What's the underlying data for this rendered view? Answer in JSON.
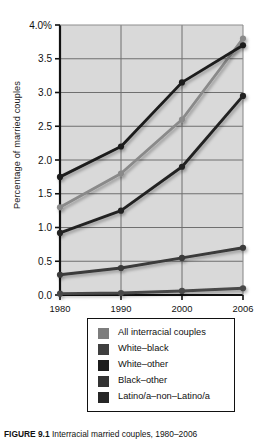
{
  "figure": {
    "caption_label": "FIGURE 9.1",
    "caption_text": "Interracial married couples, 1980–2006"
  },
  "chart_data": {
    "type": "line",
    "title": "",
    "xlabel": "",
    "ylabel": "Percentage of married couples",
    "x": [
      1980,
      1990,
      2000,
      2006
    ],
    "categories": [
      "1980",
      "1990",
      "2000",
      "2006"
    ],
    "xtick_labels": [
      "1980",
      "1990",
      "2000",
      "2006"
    ],
    "ytick_labels": [
      "0.0",
      "0.5",
      "1.0",
      "1.5",
      "2.0",
      "2.5",
      "3.0",
      "3.5",
      "4.0%"
    ],
    "ytick_values": [
      0.0,
      0.5,
      1.0,
      1.5,
      2.0,
      2.5,
      3.0,
      3.5,
      4.0
    ],
    "ylim": [
      0.0,
      4.0
    ],
    "grid": true,
    "grid_axis": "y-and-x",
    "plot_background": "#d9d9d9",
    "legend_position": "below-axes",
    "series": [
      {
        "name": "All interracial couples",
        "color": "#8a8a8a",
        "values": [
          1.3,
          1.8,
          2.6,
          3.8
        ]
      },
      {
        "name": "White–black",
        "color": "#4a4a4a",
        "values": [
          0.02,
          0.03,
          0.06,
          0.1
        ]
      },
      {
        "name": "White–other",
        "color": "#1c1c1c",
        "values": [
          1.75,
          2.2,
          3.15,
          3.7
        ]
      },
      {
        "name": "Black–other",
        "color": "#3a3a3a",
        "values": [
          0.3,
          0.4,
          0.55,
          0.7
        ]
      },
      {
        "name": "Latino/a–non–Latino/a",
        "color": "#242424",
        "values": [
          0.92,
          1.25,
          1.9,
          2.95
        ]
      }
    ]
  },
  "legend": {
    "items": [
      {
        "label": "All interracial couples",
        "color": "#7d7d7d"
      },
      {
        "label": "White–black",
        "color": "#3f3f3f"
      },
      {
        "label": "White–other",
        "color": "#1c1c1c"
      },
      {
        "label": "Black–other",
        "color": "#333333"
      },
      {
        "label": "Latino/a–non–Latino/a",
        "color": "#262626"
      }
    ]
  }
}
